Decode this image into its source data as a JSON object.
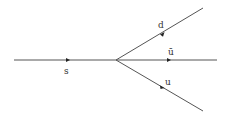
{
  "diagram": {
    "type": "feynman",
    "line_color": "#555555",
    "label_color": "#333333",
    "incoming": {
      "label": "s"
    },
    "outgoing": [
      {
        "label": "d"
      },
      {
        "label": "ū"
      },
      {
        "label": "u"
      }
    ]
  }
}
